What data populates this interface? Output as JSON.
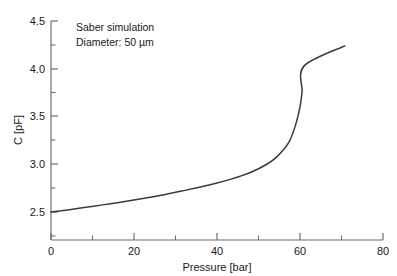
{
  "chart_data": {
    "type": "line",
    "title": "",
    "xlabel": "Pressure [bar]",
    "ylabel": "C [pF]",
    "xlim": [
      0,
      80
    ],
    "ylim": [
      2.38,
      4.5
    ],
    "grid": false,
    "legend": null,
    "xticks": [
      0,
      20,
      40,
      60,
      80
    ],
    "xticklabels": [
      "0",
      "20",
      "40",
      "60",
      "80"
    ],
    "xminorticks": [
      10,
      30,
      50,
      70
    ],
    "yticks": [
      2.5,
      3.0,
      3.5,
      4.0,
      4.5
    ],
    "yticklabels": [
      "2.5",
      "3.0",
      "3.5",
      "4.0",
      "4.5"
    ],
    "yminorticks": [
      2.75,
      3.25,
      3.75,
      4.25
    ],
    "annotations": [
      "Saber simulation",
      "Diameter: 50 µm"
    ],
    "series": [
      {
        "name": "C(P)",
        "color": "#3a3a3a",
        "x": [
          0,
          4,
          8,
          12,
          16,
          20,
          24,
          28,
          32,
          36,
          40,
          43,
          46,
          49,
          52,
          54,
          56,
          57.5,
          59,
          60,
          60.5,
          61,
          70.8
        ],
        "y": [
          2.5,
          2.522,
          2.546,
          2.572,
          2.598,
          2.625,
          2.655,
          2.688,
          2.724,
          2.762,
          2.803,
          2.839,
          2.881,
          2.932,
          3.0,
          3.062,
          3.152,
          3.245,
          3.42,
          3.6,
          3.76,
          4.03,
          4.24
        ]
      }
    ]
  },
  "axis_label_x": "Pressure [bar]",
  "axis_label_y": "C [pF]",
  "note_line1": "Saber simulation",
  "note_line2": "Diameter: 50 µm",
  "tick_x_0": "0",
  "tick_x_1": "20",
  "tick_x_2": "40",
  "tick_x_3": "60",
  "tick_x_4": "80",
  "tick_y_0": "2.5",
  "tick_y_1": "3.0",
  "tick_y_2": "3.5",
  "tick_y_3": "4.0",
  "tick_y_4": "4.5"
}
